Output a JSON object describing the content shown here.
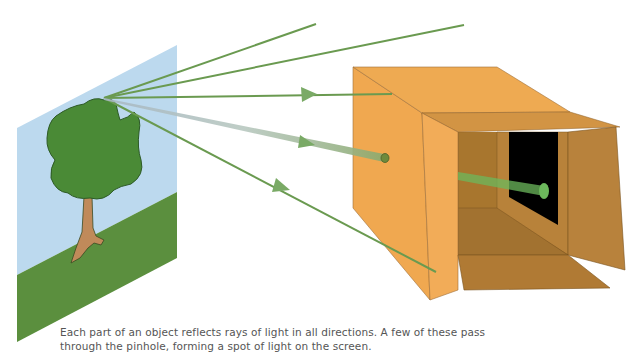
{
  "diagram": {
    "elements": {
      "scene_panel": "Object scene (sky, grass, tree)",
      "tree": "Object reflecting light",
      "rays": [
        "ray-upper-1",
        "ray-upper-2",
        "ray-middle",
        "ray-through-pinhole",
        "ray-lower"
      ],
      "box": "Pinhole camera box",
      "pinhole": "Pinhole",
      "screen": "Screen (dark back panel)",
      "light_spot": "Spot of light on screen"
    },
    "colors": {
      "sky": "#bcd9ee",
      "grass": "#5b8f3e",
      "tree_leaves": "#4a8a36",
      "tree_outline": "#2d5a26",
      "trunk": "#c08a5a",
      "ray": "#6a9a50",
      "box_front": "#f0a850",
      "box_top": "#eea84c",
      "box_inner": "#b07a2e",
      "box_inner_dark": "#9a6a26",
      "screen": "#000000",
      "light_spot": "#6cb85c"
    }
  },
  "caption": {
    "line1": "Each part of an object reflects rays of light in all directions. A few of these pass",
    "line2": "through the pinhole, forming a spot of light on the screen."
  }
}
